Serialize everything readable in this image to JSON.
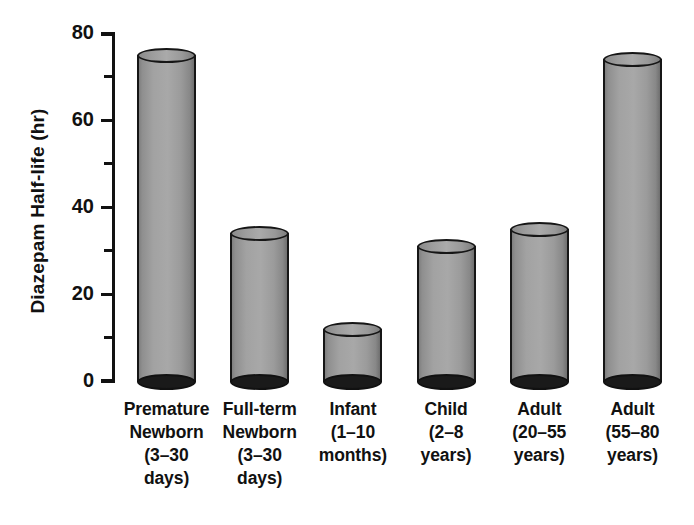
{
  "chart_data": {
    "type": "bar",
    "title": "",
    "subtitle": "",
    "xlabel": "",
    "ylabel": "Diazepam Half-life (hr)",
    "ylim": [
      0,
      80
    ],
    "ytick_labels": [
      "0",
      "20",
      "40",
      "60",
      "80"
    ],
    "ytick_values": [
      0,
      20,
      40,
      60,
      80
    ],
    "yminor_ticks": [
      10,
      30,
      50,
      70
    ],
    "grid": false,
    "legend": "none",
    "categories": [
      "Premature Newborn (3–30 days)",
      "Full-term Newborn (3–30 days)",
      "Infant (1–10 months)",
      "Child (2–8 years)",
      "Adult (20–55 years)",
      "Adult (55–80 years)"
    ],
    "values": [
      75,
      34,
      12,
      31,
      35,
      74
    ],
    "bars": [
      {
        "value": 75,
        "label_lines": [
          "Premature",
          "Newborn",
          "(3–30",
          "days)"
        ]
      },
      {
        "value": 34,
        "label_lines": [
          "Full-term",
          "Newborn",
          "(3–30",
          "days)"
        ]
      },
      {
        "value": 12,
        "label_lines": [
          "Infant",
          "(1–10",
          "months)"
        ]
      },
      {
        "value": 31,
        "label_lines": [
          "Child",
          "(2–8",
          "years)"
        ]
      },
      {
        "value": 35,
        "label_lines": [
          "Adult",
          "(20–55",
          "years)"
        ]
      },
      {
        "value": 74,
        "label_lines": [
          "Adult",
          "(55–80",
          "years)"
        ]
      }
    ],
    "colors": {
      "bar_fill": "#a2a2a2",
      "bar_outline": "#161616",
      "bar_base": "#1a1a1a",
      "axis": "#111111",
      "text": "#111111",
      "background": "#ffffff"
    }
  }
}
